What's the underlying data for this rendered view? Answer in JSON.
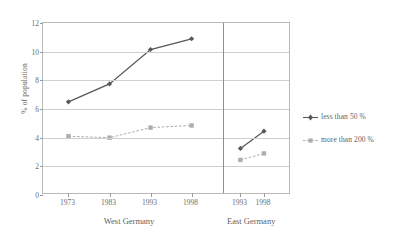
{
  "chart_data": {
    "type": "line",
    "title": "",
    "xlabel": "",
    "ylabel": "% of population",
    "ylim": [
      0,
      12
    ],
    "yticks": [
      0,
      2,
      4,
      6,
      8,
      10,
      12
    ],
    "grid": true,
    "legend_position": "right",
    "groups": [
      {
        "name": "West Germany",
        "categories": [
          "1973",
          "1983",
          "1993",
          "1998"
        ]
      },
      {
        "name": "East Germany",
        "categories": [
          "1993",
          "1998"
        ]
      }
    ],
    "categories": [
      "1973",
      "1983",
      "1993",
      "1998",
      "1993",
      "1998"
    ],
    "series": [
      {
        "name": "less than 50 %",
        "color": "#595959",
        "marker": "diamond",
        "values": [
          6.5,
          7.75,
          10.15,
          10.9,
          3.25,
          4.45
        ],
        "segments": [
          {
            "group": "West Germany",
            "x": [
              "1973",
              "1983",
              "1993",
              "1998"
            ],
            "values": [
              6.5,
              7.75,
              10.15,
              10.9
            ]
          },
          {
            "group": "East Germany",
            "x": [
              "1993",
              "1998"
            ],
            "values": [
              3.25,
              4.45
            ]
          }
        ]
      },
      {
        "name": "more than 200 %",
        "color": "#adadad",
        "marker": "square",
        "values": [
          4.1,
          4.0,
          4.7,
          4.85,
          2.45,
          2.9
        ],
        "segments": [
          {
            "group": "West Germany",
            "x": [
              "1973",
              "1983",
              "1993",
              "1998"
            ],
            "values": [
              4.1,
              4.0,
              4.7,
              4.85
            ]
          },
          {
            "group": "East Germany",
            "x": [
              "1993",
              "1998"
            ],
            "values": [
              2.45,
              2.9
            ]
          }
        ]
      }
    ]
  },
  "legend": {
    "items": [
      {
        "label": "less than 50 %",
        "color": "#595959",
        "marker": "diamond"
      },
      {
        "label": "more than 200 %",
        "color": "#adadad",
        "marker": "square"
      }
    ]
  }
}
